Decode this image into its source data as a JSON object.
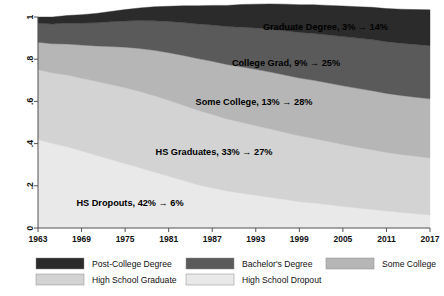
{
  "chart_data": {
    "type": "area",
    "title": "",
    "xlabel": "",
    "ylabel": "",
    "stacked": true,
    "grid": false,
    "legend_position": "bottom",
    "xlim": [
      1963,
      2017
    ],
    "ylim": [
      0,
      1
    ],
    "x_ticks": [
      "1963",
      "1969",
      "1975",
      "1981",
      "1987",
      "1993",
      "1999",
      "2005",
      "2011",
      "2017"
    ],
    "y_ticks": [
      "0",
      ".2",
      ".4",
      ".6",
      ".8",
      "1"
    ],
    "x": [
      1963,
      1965,
      1967,
      1969,
      1971,
      1973,
      1975,
      1977,
      1979,
      1981,
      1983,
      1985,
      1987,
      1989,
      1991,
      1993,
      1995,
      1997,
      1999,
      2001,
      2003,
      2005,
      2007,
      2009,
      2011,
      2013,
      2015,
      2017
    ],
    "series": [
      {
        "name": "High School Dropout",
        "color": "#e9e9e9",
        "order": 1,
        "values": [
          0.42,
          0.4,
          0.385,
          0.365,
          0.345,
          0.325,
          0.305,
          0.285,
          0.265,
          0.245,
          0.225,
          0.205,
          0.19,
          0.175,
          0.165,
          0.155,
          0.145,
          0.135,
          0.125,
          0.118,
          0.11,
          0.102,
          0.095,
          0.088,
          0.08,
          0.074,
          0.068,
          0.062
        ]
      },
      {
        "name": "High School Graduate",
        "color": "#d3d3d3",
        "order": 2,
        "values": [
          0.33,
          0.335,
          0.34,
          0.345,
          0.35,
          0.355,
          0.36,
          0.362,
          0.362,
          0.36,
          0.357,
          0.353,
          0.348,
          0.342,
          0.336,
          0.33,
          0.324,
          0.318,
          0.312,
          0.306,
          0.3,
          0.294,
          0.288,
          0.283,
          0.278,
          0.274,
          0.272,
          0.27
        ]
      },
      {
        "name": "Some College",
        "color": "#b6b6b6",
        "order": 3,
        "values": [
          0.13,
          0.138,
          0.147,
          0.157,
          0.168,
          0.18,
          0.192,
          0.204,
          0.215,
          0.226,
          0.236,
          0.245,
          0.252,
          0.258,
          0.263,
          0.267,
          0.27,
          0.272,
          0.274,
          0.276,
          0.277,
          0.278,
          0.279,
          0.28,
          0.28,
          0.28,
          0.28,
          0.28
        ]
      },
      {
        "name": "Bachelor's Degree",
        "color": "#5a5a5a",
        "order": 4,
        "values": [
          0.09,
          0.094,
          0.099,
          0.104,
          0.11,
          0.117,
          0.124,
          0.132,
          0.14,
          0.148,
          0.156,
          0.164,
          0.172,
          0.18,
          0.188,
          0.196,
          0.203,
          0.21,
          0.216,
          0.222,
          0.228,
          0.233,
          0.238,
          0.242,
          0.245,
          0.248,
          0.25,
          0.252
        ]
      },
      {
        "name": "Post-College Degree",
        "color": "#2b2b2b",
        "order": 5,
        "values": [
          0.03,
          0.033,
          0.036,
          0.04,
          0.044,
          0.049,
          0.054,
          0.06,
          0.066,
          0.072,
          0.079,
          0.086,
          0.093,
          0.1,
          0.107,
          0.113,
          0.12,
          0.126,
          0.131,
          0.136,
          0.14,
          0.145,
          0.149,
          0.153,
          0.157,
          0.161,
          0.165,
          0.17
        ]
      }
    ],
    "annotations": [
      {
        "id": "grad-degree",
        "text": "Graduate Degree, 3% → 14%",
        "x": 388,
        "y": 27,
        "anchor": "end",
        "color": "#000000"
      },
      {
        "id": "college-grad",
        "text": "College Grad, 9% → 25%",
        "x": 286,
        "y": 63,
        "anchor": "middle",
        "color": "#000000"
      },
      {
        "id": "some-college",
        "text": "Some College, 13% → 28%",
        "x": 254,
        "y": 102,
        "anchor": "middle",
        "color": "#000000"
      },
      {
        "id": "hs-graduates",
        "text": "HS Graduates, 33% → 27%",
        "x": 214,
        "y": 152,
        "anchor": "middle",
        "color": "#000000"
      },
      {
        "id": "hs-dropouts",
        "text": "HS Dropouts, 42% → 6%",
        "x": 130,
        "y": 203,
        "anchor": "middle",
        "color": "#000000"
      }
    ]
  },
  "legend": {
    "items": [
      {
        "label": "Post-College Degree",
        "color": "#2b2b2b"
      },
      {
        "label": "Bachelor's Degree",
        "color": "#5a5a5a"
      },
      {
        "label": "Some College",
        "color": "#b6b6b6"
      },
      {
        "label": "High School Graduate",
        "color": "#d3d3d3"
      },
      {
        "label": "High School Dropout",
        "color": "#e9e9e9"
      }
    ]
  }
}
